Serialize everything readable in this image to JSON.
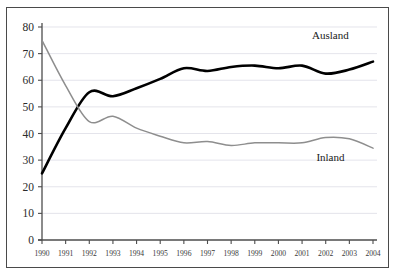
{
  "chart_data": {
    "type": "line",
    "title": "",
    "xlabel": "",
    "ylabel": "",
    "grid": "horizontal",
    "legend_position": "inline-annotation",
    "ylim": [
      0,
      80
    ],
    "yticks": [
      0,
      10,
      20,
      30,
      40,
      50,
      60,
      70,
      80
    ],
    "ytick_labels": [
      "0",
      "10",
      "20",
      "30",
      "40",
      "50",
      "60",
      "70",
      "80"
    ],
    "categories": [
      "1990",
      "1991",
      "1992",
      "1993",
      "1994",
      "1995",
      "1996",
      "1997",
      "1998",
      "1999",
      "2000",
      "2001",
      "2002",
      "2003",
      "2004"
    ],
    "x": [
      1990,
      1991,
      1992,
      1993,
      1994,
      1995,
      1996,
      1997,
      1998,
      1999,
      2000,
      2001,
      2002,
      2003,
      2004
    ],
    "series": [
      {
        "name": "Ausland",
        "color": "#000000",
        "style": "thick-black",
        "label_x": 2002.2,
        "label_y": 75.5,
        "values": [
          25,
          42,
          55.5,
          54,
          57,
          60.5,
          64.5,
          63.5,
          65,
          65.5,
          64.5,
          65.5,
          62.5,
          64,
          67
        ]
      },
      {
        "name": "Inland",
        "color": "#8e8e8e",
        "style": "thin-gray",
        "label_x": 2002.2,
        "label_y": 29.5,
        "values": [
          75,
          58,
          44.5,
          46.5,
          42,
          39,
          36.5,
          37,
          35.5,
          36.5,
          36.5,
          36.5,
          38.5,
          38,
          34.5
        ]
      }
    ]
  },
  "colors": {
    "frame": "#4a4a4a",
    "grid": "#d9d9e2",
    "axis": "#4d4d4d",
    "background": "#ffffff"
  }
}
